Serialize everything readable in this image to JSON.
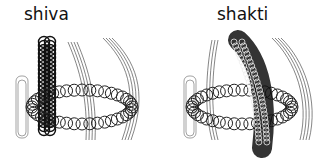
{
  "figures": [
    {
      "label": "shiva"
    },
    {
      "label": "shakti"
    }
  ]
}
